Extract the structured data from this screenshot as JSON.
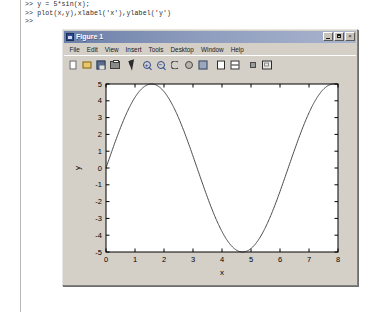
{
  "command_window": {
    "name": "MATLAB Command Window",
    "lines": [
      ">> y = 5*sin(x);",
      ">> plot(x,y),xlabel('x'),ylabel('y')",
      ">>"
    ]
  },
  "figure_window": {
    "title": "Figure 1",
    "title_icon": "matlab-figure-icon",
    "window_buttons": [
      {
        "name": "minimize",
        "label": "_"
      },
      {
        "name": "maximize",
        "label": "□"
      },
      {
        "name": "close",
        "label": "×"
      }
    ],
    "menus": [
      {
        "label": "File"
      },
      {
        "label": "Edit"
      },
      {
        "label": "View"
      },
      {
        "label": "Insert"
      },
      {
        "label": "Tools"
      },
      {
        "label": "Desktop"
      },
      {
        "label": "Window"
      },
      {
        "label": "Help"
      }
    ],
    "toolbar": [
      {
        "name": "new-figure",
        "icon": "document-icon",
        "tooltip": "New Figure"
      },
      {
        "name": "open-file",
        "icon": "folder-open-icon",
        "tooltip": "Open File"
      },
      {
        "name": "save-figure",
        "icon": "floppy-disk-icon",
        "tooltip": "Save Figure"
      },
      {
        "name": "print-figure",
        "icon": "printer-icon",
        "tooltip": "Print Figure"
      },
      {
        "name": "separator-1",
        "icon": "separator",
        "tooltip": ""
      },
      {
        "name": "edit-plot",
        "icon": "arrow-pointer-icon",
        "tooltip": "Edit Plot"
      },
      {
        "name": "zoom-in",
        "icon": "magnifier-plus-icon",
        "tooltip": "Zoom In"
      },
      {
        "name": "zoom-out",
        "icon": "magnifier-minus-icon",
        "tooltip": "Zoom Out"
      },
      {
        "name": "rotate-3d",
        "icon": "rotate-icon",
        "tooltip": "Rotate 3D"
      },
      {
        "name": "pan",
        "icon": "hand-pan-icon",
        "tooltip": "Pan"
      },
      {
        "name": "data-cursor",
        "icon": "data-cursor-icon",
        "tooltip": "Data Cursor"
      },
      {
        "name": "separator-2",
        "icon": "separator",
        "tooltip": ""
      },
      {
        "name": "insert-legend",
        "icon": "legend-icon",
        "tooltip": "Insert Legend"
      },
      {
        "name": "insert-colorbar",
        "icon": "colorbar-icon",
        "tooltip": "Insert Colorbar"
      },
      {
        "name": "separator-3",
        "icon": "separator",
        "tooltip": ""
      },
      {
        "name": "hide-plot-tools",
        "icon": "small-square-icon",
        "tooltip": "Hide Plot Tools"
      },
      {
        "name": "show-plot-tools",
        "icon": "plot-tools-icon",
        "tooltip": "Show Plot Tools"
      }
    ]
  },
  "chart_data": {
    "type": "line",
    "title": "",
    "xlabel": "x",
    "ylabel": "y",
    "expression": "y = 5*sin(x)",
    "amplitude": 5,
    "xlim": [
      0,
      8
    ],
    "ylim": [
      -5,
      5
    ],
    "xticks": [
      0,
      1,
      2,
      3,
      4,
      5,
      6,
      7,
      8
    ],
    "xticklabels": [
      "0",
      "1",
      "2",
      "3",
      "4",
      "5",
      "6",
      "7",
      "8"
    ],
    "yticks": [
      -5,
      -4,
      -3,
      -2,
      -1,
      0,
      1,
      2,
      3,
      4,
      5
    ],
    "yticklabels": [
      "-5",
      "-4",
      "-3",
      "-2",
      "-1",
      "0",
      "1",
      "2",
      "3",
      "4",
      "5"
    ],
    "grid": false,
    "legend": null,
    "line_color": "#4a4a4a",
    "axes_color": "#000000",
    "background": "#ffffff",
    "series": [
      {
        "name": "5*sin(x)",
        "x": [
          0,
          0.2,
          0.4,
          0.6,
          0.8,
          1.0,
          1.2,
          1.4,
          1.5708,
          1.8,
          2.0,
          2.2,
          2.4,
          2.6,
          2.8,
          3.0,
          3.1416,
          3.4,
          3.6,
          3.8,
          4.0,
          4.2,
          4.4,
          4.6,
          4.7124,
          5.0,
          5.2,
          5.4,
          5.6,
          5.8,
          6.0,
          6.2832,
          6.5,
          6.8,
          7.0,
          7.2,
          7.4,
          7.6,
          7.8,
          8.0
        ],
        "y": [
          0,
          0.993,
          1.947,
          2.823,
          3.587,
          4.207,
          4.66,
          4.927,
          5.0,
          4.868,
          4.546,
          4.045,
          3.382,
          2.579,
          1.676,
          0.706,
          0,
          -1.287,
          -2.216,
          -3.081,
          -3.784,
          -4.371,
          -4.789,
          -4.986,
          -5.0,
          -4.795,
          -4.397,
          -3.851,
          -3.172,
          -2.393,
          -1.397,
          0,
          1.079,
          2.463,
          3.285,
          3.957,
          4.45,
          4.771,
          4.949,
          4.947
        ],
        "color": "#4a4a4a",
        "style": "solid",
        "width": 1
      }
    ]
  }
}
